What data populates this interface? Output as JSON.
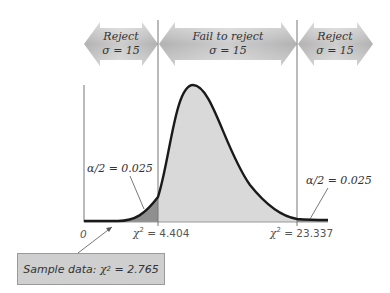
{
  "arrows": {
    "left": {
      "line1": "Reject",
      "line2": "σ = 15"
    },
    "middle": {
      "line1": "Fail to reject",
      "line2": "σ = 15"
    },
    "right": {
      "line1": "Reject",
      "line2": "σ = 15"
    }
  },
  "annotations": {
    "left_tail": "α/2 = 0.025",
    "right_tail": "α/2 = 0.025"
  },
  "axis": {
    "origin": "0",
    "left_critical": {
      "symbol": "χ",
      "exp": "2",
      "eq": " = 4.404"
    },
    "right_critical": {
      "symbol": "χ",
      "exp": "2",
      "eq": " = 23.337"
    }
  },
  "sample": {
    "prefix": "Sample data: ",
    "symbol": "χ",
    "exp": "2",
    "eq": " = 2.765"
  },
  "colors": {
    "arrow_fill": "#bdbdbd",
    "body_fill": "#d9d9d9",
    "tail_fill": "#8f8f8f",
    "curve": "#1a1a1a",
    "lines": "#777777"
  }
}
